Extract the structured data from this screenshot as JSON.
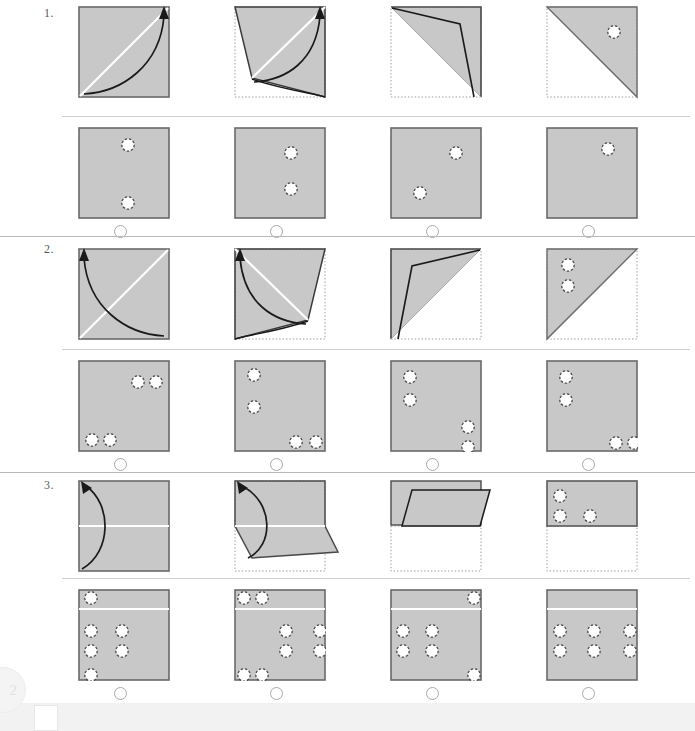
{
  "meta": {
    "test_name": "Paper Folding Test",
    "page_badge": "2",
    "colors": {
      "paper_fill": "#c8c8c8",
      "paper_edge": "#6a6a6a",
      "crease": "#ffffff",
      "fold_line": "#1a1a1a",
      "ghost_outline": "#9a9a9a",
      "rule_dark": "#b9b9bb",
      "rule_light": "#cfcfd1",
      "radio_stroke": "#a8a8aa",
      "hole_fill": "#ffffff",
      "hole_stroke": "#4a4a4a"
    }
  },
  "questions": [
    {
      "number": "1.",
      "fold_axis": "diagonal-bl-tr",
      "steps": [
        {
          "label": "step-1-unfolded-square-with-diagonal-crease",
          "state": "flat"
        },
        {
          "label": "step-2-corner-lifting",
          "state": "folding"
        },
        {
          "label": "step-3-corner-nearly-folded",
          "state": "folding-late"
        },
        {
          "label": "step-4-folded-triangle-with-punched-hole",
          "state": "folded",
          "punches": [
            {
              "x": 68,
              "y": 26
            }
          ]
        }
      ],
      "options": [
        {
          "id": "1A",
          "holes": [
            {
              "x": 50,
              "y": 18
            },
            {
              "x": 50,
              "y": 76
            }
          ],
          "selected": false
        },
        {
          "id": "1B",
          "holes": [
            {
              "x": 57,
              "y": 26
            },
            {
              "x": 57,
              "y": 62
            }
          ],
          "selected": false
        },
        {
          "id": "1C",
          "holes": [
            {
              "x": 66,
              "y": 26
            },
            {
              "x": 30,
              "y": 66
            }
          ],
          "selected": false
        },
        {
          "id": "1D",
          "holes": [
            {
              "x": 62,
              "y": 22
            }
          ],
          "selected": false
        }
      ]
    },
    {
      "number": "2.",
      "fold_axis": "diagonal-br-tl",
      "steps": [
        {
          "label": "step-1-unfolded-square-with-diagonal-crease",
          "state": "flat"
        },
        {
          "label": "step-2-corner-lifting",
          "state": "folding"
        },
        {
          "label": "step-3-corner-nearly-folded",
          "state": "folding-late"
        },
        {
          "label": "step-4-folded-triangle-with-punched-holes",
          "state": "folded",
          "punches": [
            {
              "x": 22,
              "y": 18
            },
            {
              "x": 22,
              "y": 38
            }
          ]
        }
      ],
      "options": [
        {
          "id": "2A",
          "holes": [
            {
              "x": 60,
              "y": 22
            },
            {
              "x": 78,
              "y": 22
            },
            {
              "x": 14,
              "y": 80
            },
            {
              "x": 32,
              "y": 80
            }
          ],
          "selected": false
        },
        {
          "id": "2B",
          "holes": [
            {
              "x": 20,
              "y": 15
            },
            {
              "x": 20,
              "y": 47
            },
            {
              "x": 62,
              "y": 82
            },
            {
              "x": 82,
              "y": 82
            }
          ],
          "selected": false
        },
        {
          "id": "2C",
          "holes": [
            {
              "x": 20,
              "y": 17
            },
            {
              "x": 20,
              "y": 40
            },
            {
              "x": 78,
              "y": 67
            },
            {
              "x": 78,
              "y": 87
            }
          ],
          "selected": false
        },
        {
          "id": "2D",
          "holes": [
            {
              "x": 20,
              "y": 17
            },
            {
              "x": 20,
              "y": 40
            },
            {
              "x": 70,
              "y": 83
            },
            {
              "x": 88,
              "y": 83
            }
          ],
          "selected": false
        }
      ]
    },
    {
      "number": "3.",
      "fold_axis": "horizontal-bottom-up",
      "steps": [
        {
          "label": "step-1-unfolded-square-with-horizontal-crease",
          "state": "flat"
        },
        {
          "label": "step-2-bottom-half-lifting",
          "state": "folding"
        },
        {
          "label": "step-3-bottom-half-nearly-folded",
          "state": "folding-late"
        },
        {
          "label": "step-4-folded-half-with-punched-holes",
          "state": "folded",
          "punches": [
            {
              "x": 14,
              "y": 16
            },
            {
              "x": 14,
              "y": 62
            },
            {
              "x": 46,
              "y": 62
            }
          ]
        }
      ],
      "options": [
        {
          "id": "3A",
          "holes": [
            {
              "x": 13,
              "y": 9
            },
            {
              "x": 13,
              "y": 42
            },
            {
              "x": 13,
              "y": 62
            },
            {
              "x": 13,
              "y": 92
            },
            {
              "x": 44,
              "y": 42
            },
            {
              "x": 44,
              "y": 62
            }
          ],
          "selected": false
        },
        {
          "id": "3B",
          "holes": [
            {
              "x": 10,
              "y": 9
            },
            {
              "x": 28,
              "y": 9
            },
            {
              "x": 10,
              "y": 91
            },
            {
              "x": 28,
              "y": 91
            },
            {
              "x": 52,
              "y": 42
            },
            {
              "x": 52,
              "y": 62
            },
            {
              "x": 86,
              "y": 42
            },
            {
              "x": 86,
              "y": 62
            }
          ],
          "selected": false
        },
        {
          "id": "3C",
          "holes": [
            {
              "x": 84,
              "y": 9
            },
            {
              "x": 84,
              "y": 91
            },
            {
              "x": 13,
              "y": 42
            },
            {
              "x": 13,
              "y": 62
            },
            {
              "x": 42,
              "y": 42
            },
            {
              "x": 42,
              "y": 62
            }
          ],
          "selected": false
        },
        {
          "id": "3D",
          "holes": [
            {
              "x": 14,
              "y": 42
            },
            {
              "x": 14,
              "y": 62
            },
            {
              "x": 48,
              "y": 42
            },
            {
              "x": 48,
              "y": 62
            },
            {
              "x": 84,
              "y": 42
            },
            {
              "x": 84,
              "y": 62
            }
          ],
          "selected": false
        }
      ]
    }
  ]
}
